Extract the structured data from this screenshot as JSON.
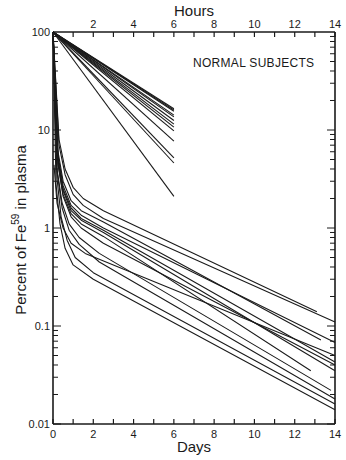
{
  "chart_data": {
    "type": "line",
    "title": "",
    "annotation": "NORMAL SUBJECTS",
    "xlabel": "Days",
    "x2label": "Hours",
    "ylabel": "Percent of Fe59 in plasma",
    "ylabel_parts": {
      "pre": "Percent of Fe",
      "sup": "59",
      "post": " in plasma"
    },
    "yscale": "log",
    "ylim": [
      0.01,
      100
    ],
    "xlim": [
      0,
      14
    ],
    "x2lim": [
      0,
      14
    ],
    "grid": false,
    "legend": "none",
    "y_ticks": [
      {
        "v": 100,
        "label": "100"
      },
      {
        "v": 10,
        "label": "10"
      },
      {
        "v": 1,
        "label": "1"
      },
      {
        "v": 0.1,
        "label": "0.1"
      },
      {
        "v": 0.01,
        "label": "0.01"
      }
    ],
    "x_ticks": [
      "0",
      "2",
      "4",
      "6",
      "8",
      "10",
      "12",
      "14"
    ],
    "x2_ticks": [
      "2",
      "4",
      "6",
      "8",
      "10",
      "12",
      "14"
    ],
    "hours_series": [
      {
        "name": "subject-h1",
        "x": [
          0,
          6
        ],
        "y": [
          100,
          16.5
        ]
      },
      {
        "name": "subject-h2",
        "x": [
          0,
          6
        ],
        "y": [
          100,
          16.0
        ]
      },
      {
        "name": "subject-h3",
        "x": [
          0,
          6
        ],
        "y": [
          100,
          15.5
        ]
      },
      {
        "name": "subject-h4",
        "x": [
          0,
          6
        ],
        "y": [
          100,
          14.2
        ]
      },
      {
        "name": "subject-h5",
        "x": [
          0,
          6
        ],
        "y": [
          100,
          13.6
        ]
      },
      {
        "name": "subject-h6",
        "x": [
          0,
          6
        ],
        "y": [
          100,
          12.5
        ]
      },
      {
        "name": "subject-h7",
        "x": [
          0,
          6
        ],
        "y": [
          100,
          11.5
        ]
      },
      {
        "name": "subject-h8",
        "x": [
          0,
          6
        ],
        "y": [
          100,
          10.7
        ]
      },
      {
        "name": "subject-h9",
        "x": [
          0,
          6
        ],
        "y": [
          100,
          9.8
        ]
      },
      {
        "name": "subject-h10",
        "x": [
          0,
          6
        ],
        "y": [
          100,
          7.7
        ]
      },
      {
        "name": "subject-h11",
        "x": [
          0,
          6
        ],
        "y": [
          100,
          5.2
        ]
      },
      {
        "name": "subject-h12",
        "x": [
          0,
          6
        ],
        "y": [
          100,
          4.6
        ]
      },
      {
        "name": "subject-h13",
        "x": [
          0,
          6
        ],
        "y": [
          100,
          2.1
        ]
      }
    ],
    "days_series": [
      {
        "name": "subject-d1",
        "x": [
          0,
          0.3,
          0.6,
          1.0,
          1.5,
          2.5,
          13.1
        ],
        "y": [
          100,
          8,
          4.0,
          2.6,
          2.0,
          1.5,
          0.14
        ]
      },
      {
        "name": "subject-d2",
        "x": [
          0,
          0.3,
          0.6,
          1.0,
          1.5,
          2.5,
          14
        ],
        "y": [
          100,
          7,
          3.5,
          2.2,
          1.7,
          1.25,
          0.11
        ]
      },
      {
        "name": "subject-d3",
        "x": [
          0,
          0.25,
          0.5,
          0.9,
          1.4,
          2.5,
          13.3
        ],
        "y": [
          100,
          6,
          3.0,
          1.9,
          1.5,
          1.15,
          0.072
        ]
      },
      {
        "name": "subject-d4",
        "x": [
          0,
          0.25,
          0.5,
          0.9,
          1.4,
          2.5,
          14
        ],
        "y": [
          100,
          5.5,
          2.7,
          1.7,
          1.35,
          1.0,
          0.068
        ]
      },
      {
        "name": "subject-d5",
        "x": [
          0,
          0.25,
          0.5,
          0.9,
          1.4,
          2.5,
          14
        ],
        "y": [
          100,
          5,
          2.5,
          1.6,
          1.25,
          0.95,
          0.043
        ]
      },
      {
        "name": "subject-d6",
        "x": [
          0,
          0.25,
          0.5,
          0.9,
          1.4,
          2.5,
          14
        ],
        "y": [
          100,
          5,
          2.4,
          1.5,
          1.2,
          0.9,
          0.035
        ]
      },
      {
        "name": "subject-d7",
        "x": [
          0,
          0.25,
          0.5,
          0.9,
          1.4,
          2.5,
          12.8
        ],
        "y": [
          100,
          4.5,
          2.2,
          1.4,
          1.1,
          0.82,
          0.035
        ]
      },
      {
        "name": "subject-d8",
        "x": [
          0,
          0.25,
          0.5,
          0.9,
          1.4,
          2.5,
          14
        ],
        "y": [
          100,
          4.5,
          2.1,
          1.3,
          1.0,
          0.7,
          0.04
        ]
      },
      {
        "name": "subject-d9",
        "x": [
          0,
          0.2,
          0.45,
          0.8,
          1.3,
          2.3,
          13.8
        ],
        "y": [
          100,
          4,
          1.8,
          1.1,
          0.8,
          0.55,
          0.022
        ]
      },
      {
        "name": "subject-d10",
        "x": [
          0,
          0.2,
          0.45,
          0.8,
          1.3,
          2.3,
          14
        ],
        "y": [
          100,
          3.8,
          1.6,
          0.95,
          0.68,
          0.45,
          0.018
        ]
      },
      {
        "name": "subject-d11",
        "x": [
          0,
          0.2,
          0.4,
          0.7,
          1.1,
          2.0,
          14
        ],
        "y": [
          100,
          3.2,
          1.3,
          0.75,
          0.5,
          0.35,
          0.016
        ]
      },
      {
        "name": "subject-d12",
        "x": [
          0,
          0.15,
          0.35,
          0.6,
          1.0,
          2.0,
          14
        ],
        "y": [
          100,
          2.8,
          1.1,
          0.62,
          0.42,
          0.3,
          0.014
        ]
      },
      {
        "name": "subject-d13",
        "x": [
          0.05,
          0.05,
          0.2,
          0.5,
          0.9,
          1.6,
          14
        ],
        "y": [
          4.4,
          4.4,
          1.8,
          1.0,
          0.7,
          0.55,
          0.05
        ]
      }
    ]
  }
}
